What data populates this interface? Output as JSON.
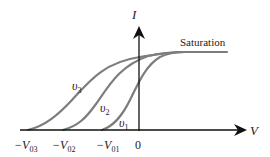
{
  "diagram": {
    "y_axis_label": "I",
    "x_axis_label": "V",
    "saturation_label": "Saturation",
    "origin_label": "0",
    "x_ticks": [
      {
        "main": "−V",
        "sub": "03"
      },
      {
        "main": "−V",
        "sub": "02"
      },
      {
        "main": "−V",
        "sub": "01"
      }
    ],
    "curves": [
      {
        "name": "υ",
        "sub": "1"
      },
      {
        "name": "υ",
        "sub": "2"
      },
      {
        "name": "υ",
        "sub": "3"
      }
    ],
    "curve_color": "#7a7a7a",
    "axis_color": "#111111"
  }
}
